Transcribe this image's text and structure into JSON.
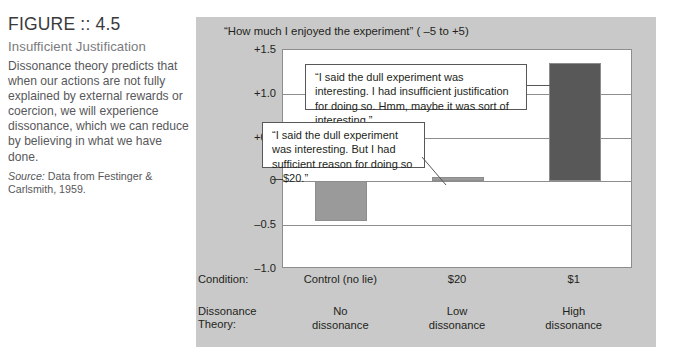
{
  "figure": {
    "title": "FIGURE :: 4.5",
    "subtitle": "Insufficient Justification",
    "body": "Dissonance theory predicts that when our actions are not fully explained by external rewards or coercion, we will experience dissonance, which we can reduce by believing in what we have done.",
    "source_label": "Source:",
    "source_text": " Data from Festinger & Carlsmith, 1959."
  },
  "callouts": [
    {
      "id": "callout-dollar1",
      "text": "“I said the dull experiment was interesting. I had insufficient justification for doing so. Hmm, maybe it was sort of interesting.”"
    },
    {
      "id": "callout-dollar20",
      "text": "“I said the dull experiment was interesting.  But I had sufficient reason for doing so—$20.”"
    }
  ],
  "axis_rows": {
    "condition_label": "Condition:",
    "theory_label_line1": "Dissonance",
    "theory_label_line2": "Theory:"
  },
  "chart_data": {
    "type": "bar",
    "title": "“How much I enjoyed the experiment” ( –5 to +5)",
    "xlabel": "",
    "ylabel": "",
    "ylim": [
      -1.0,
      1.5
    ],
    "yticks": [
      1.5,
      1.0,
      0.5,
      0,
      -0.5,
      -1.0
    ],
    "ytick_labels": [
      "+1.5",
      "+1.0",
      "+0.5",
      "0",
      "–0.5",
      "–1.0"
    ],
    "grid": true,
    "legend": "none",
    "categories": [
      "Control (no lie)",
      "$20",
      "$1"
    ],
    "dissonance_theory": [
      "No\ndissonance",
      "Low\ndissonance",
      "High\ndissonance"
    ],
    "dissonance_theory_lines": [
      [
        "No",
        "dissonance"
      ],
      [
        "Low",
        "dissonance"
      ],
      [
        "High",
        "dissonance"
      ]
    ],
    "values": [
      -0.45,
      0.05,
      1.35
    ],
    "bar_colors": [
      "#9a9a9a",
      "#9a9a9a",
      "#585858"
    ]
  },
  "colors": {
    "panel_background": "#c9c9c9",
    "plot_background": "#ffffff",
    "axis_line": "#8d8d8d",
    "bar_light": "#9a9a9a",
    "bar_dark": "#585858",
    "text": "#231f20"
  }
}
